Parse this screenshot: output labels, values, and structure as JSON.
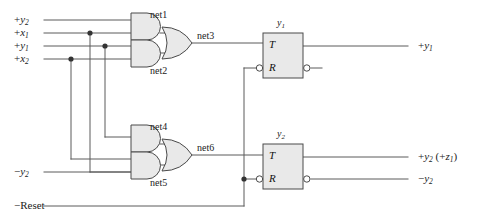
{
  "figure": {
    "type": "logic-circuit-schematic",
    "line_color": "#5a5a5a",
    "gate_fill": "#e8e8e8",
    "gate_stroke": "#4a4a4a",
    "text_color": "#222222"
  },
  "inputs": [
    {
      "id": "in-y2p",
      "sign": "+",
      "name": "y",
      "sub": "2",
      "y": 20
    },
    {
      "id": "in-x1p",
      "sign": "+",
      "name": "x",
      "sub": "1",
      "y": 33
    },
    {
      "id": "in-y1p",
      "sign": "+",
      "name": "y",
      "sub": "1",
      "y": 46
    },
    {
      "id": "in-x2p",
      "sign": "+",
      "name": "x",
      "sub": "2",
      "y": 59
    },
    {
      "id": "in-y2n",
      "sign": "−",
      "name": "y",
      "sub": "2",
      "y": 166
    },
    {
      "id": "in-reset",
      "sign": "−",
      "name": "Reset",
      "sub": "",
      "y": 206
    }
  ],
  "input_labels": {
    "y2_plus": "+y2",
    "x1_plus": "+x1",
    "y1_plus": "+y1",
    "x2_plus": "+x2",
    "y2_minus": "−y2",
    "reset": "−Reset"
  },
  "nets": [
    {
      "id": "net1",
      "label": "net1",
      "x": 150,
      "y": 18
    },
    {
      "id": "net2",
      "label": "net2",
      "x": 150,
      "y": 72
    },
    {
      "id": "net3",
      "label": "net3",
      "x": 197,
      "y": 38
    },
    {
      "id": "net4",
      "label": "net4",
      "x": 150,
      "y": 130
    },
    {
      "id": "net5",
      "label": "net5",
      "x": 150,
      "y": 184
    },
    {
      "id": "net6",
      "label": "net6",
      "x": 197,
      "y": 150
    }
  ],
  "gates": [
    {
      "id": "and-net1",
      "type": "AND",
      "output_net": "net1",
      "inputs": 2
    },
    {
      "id": "and-net2",
      "type": "AND",
      "output_net": "net2",
      "inputs": 2
    },
    {
      "id": "or-net3",
      "type": "OR",
      "output_net": "net3",
      "inputs": 2
    },
    {
      "id": "and-net4",
      "type": "AND",
      "output_net": "net4",
      "inputs": 2
    },
    {
      "id": "and-net5",
      "type": "AND",
      "output_net": "net5",
      "inputs": 2
    },
    {
      "id": "or-net6",
      "type": "OR",
      "output_net": "net6",
      "inputs": 2
    }
  ],
  "flipflops": [
    {
      "id": "ff-y1",
      "title": "y",
      "title_sub": "1",
      "pins": {
        "t": "T",
        "r": "R"
      },
      "r_inverted": true,
      "out_inverted": true,
      "box": {
        "x": 263,
        "y": 33,
        "w": 40,
        "h": 45
      }
    },
    {
      "id": "ff-y2",
      "title": "y",
      "title_sub": "2",
      "pins": {
        "t": "T",
        "r": "R"
      },
      "r_inverted": true,
      "out_inverted": true,
      "box": {
        "x": 263,
        "y": 144,
        "w": 40,
        "h": 45
      }
    }
  ],
  "outputs": [
    {
      "id": "out-y1p",
      "text": "+y1",
      "sign": "+",
      "name": "y",
      "sub": "1",
      "extra": "",
      "y": 46
    },
    {
      "id": "out-y2p",
      "text": "+y2 (+z1)",
      "sign": "+",
      "name": "y",
      "sub": "2",
      "extra": " (+z1)",
      "y": 157
    },
    {
      "id": "out-y2n",
      "text": "−y2",
      "sign": "−",
      "name": "y",
      "sub": "2",
      "extra": "",
      "y": 180
    }
  ],
  "output_labels": {
    "y1_plus": "+y1",
    "y2_plus_z1": "+y2 (+z1)",
    "y2_minus": "−y2"
  }
}
